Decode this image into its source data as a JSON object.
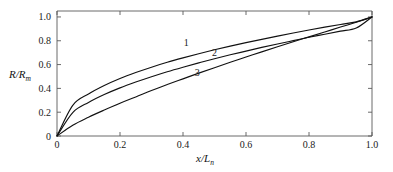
{
  "chart_data": {
    "type": "line",
    "title": "",
    "subtitle": "",
    "xlabel": "x/L",
    "xlabel_sub": "n",
    "ylabel": "R/R",
    "ylabel_sub": "m",
    "xlim": [
      0,
      1.0
    ],
    "ylim": [
      0,
      1.05
    ],
    "grid": false,
    "legend_position": "inline-curve-labels",
    "xticks": [
      {
        "value": 0,
        "label": "0"
      },
      {
        "value": 0.2,
        "label": "0.2"
      },
      {
        "value": 0.4,
        "label": "0.4"
      },
      {
        "value": 0.6,
        "label": "0.6"
      },
      {
        "value": 0.8,
        "label": "0.8"
      },
      {
        "value": 1.0,
        "label": "1.0"
      }
    ],
    "yticks": [
      {
        "value": 0,
        "label": "0"
      },
      {
        "value": 0.2,
        "label": "0.2"
      },
      {
        "value": 0.4,
        "label": "0.4"
      },
      {
        "value": 0.6,
        "label": "0.6"
      },
      {
        "value": 0.8,
        "label": "0.8"
      },
      {
        "value": 1.0,
        "label": "1.0"
      }
    ],
    "x": [
      0,
      0.05,
      0.1,
      0.15,
      0.2,
      0.25,
      0.3,
      0.35,
      0.4,
      0.45,
      0.5,
      0.55,
      0.6,
      0.65,
      0.7,
      0.75,
      0.8,
      0.85,
      0.9,
      0.95,
      1.0
    ],
    "series": [
      {
        "name": "1",
        "label": "1",
        "label_x": 0.41,
        "label_y": 0.76,
        "color": "#111111",
        "values": [
          0,
          0.258,
          0.353,
          0.424,
          0.483,
          0.533,
          0.578,
          0.619,
          0.656,
          0.691,
          0.724,
          0.755,
          0.784,
          0.812,
          0.839,
          0.865,
          0.89,
          0.914,
          0.937,
          0.959,
          1.0
        ]
      },
      {
        "name": "2",
        "label": "2",
        "label_x": 0.5,
        "label_y": 0.675,
        "color": "#111111",
        "values": [
          0,
          0.197,
          0.282,
          0.348,
          0.404,
          0.453,
          0.498,
          0.54,
          0.578,
          0.614,
          0.649,
          0.682,
          0.713,
          0.744,
          0.773,
          0.801,
          0.829,
          0.855,
          0.881,
          0.907,
          1.0
        ]
      },
      {
        "name": "3",
        "label": "3",
        "label_x": 0.445,
        "label_y": 0.5,
        "color": "#111111",
        "values": [
          0,
          0.091,
          0.158,
          0.218,
          0.275,
          0.328,
          0.382,
          0.432,
          0.48,
          0.528,
          0.574,
          0.619,
          0.663,
          0.707,
          0.75,
          0.792,
          0.833,
          0.874,
          0.915,
          0.955,
          1.0
        ]
      }
    ]
  }
}
